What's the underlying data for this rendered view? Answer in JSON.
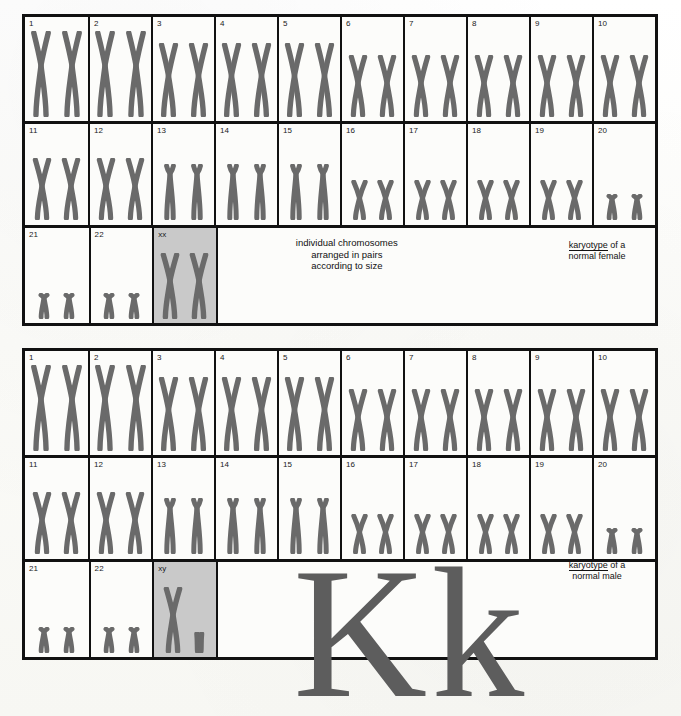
{
  "figure": {
    "annotation_note": "individual chromosomes\narranged in pairs\naccording to size",
    "annotation_line1": "individual chromosomes",
    "annotation_line2": "arranged in pairs",
    "annotation_line3": "according to size",
    "big_letters": "Kk",
    "colors": {
      "chromosome": "#6a6a6a",
      "border": "#111111",
      "shaded_cell": "#c9c9c9",
      "paper": "#fcfcfa",
      "big_letter": "#5d5d5d"
    }
  },
  "blocks": [
    {
      "id": "female",
      "caption_keyword": "karyotype",
      "caption_rest": " of a",
      "caption_line2": "normal female",
      "sex_pair_label": "xx",
      "rows": [
        {
          "name": "row-1",
          "cells": [
            {
              "label": "1",
              "pair": "large-sub"
            },
            {
              "label": "2",
              "pair": "large-sub"
            },
            {
              "label": "3",
              "pair": "large"
            },
            {
              "label": "4",
              "pair": "large"
            },
            {
              "label": "5",
              "pair": "large"
            },
            {
              "label": "6",
              "pair": "mid"
            },
            {
              "label": "7",
              "pair": "mid"
            },
            {
              "label": "8",
              "pair": "mid"
            },
            {
              "label": "9",
              "pair": "mid"
            },
            {
              "label": "10",
              "pair": "mid"
            }
          ]
        },
        {
          "name": "row-2",
          "cells": [
            {
              "label": "11",
              "pair": "mid"
            },
            {
              "label": "12",
              "pair": "mid"
            },
            {
              "label": "13",
              "pair": "acro"
            },
            {
              "label": "14",
              "pair": "acro"
            },
            {
              "label": "15",
              "pair": "acro"
            },
            {
              "label": "16",
              "pair": "small"
            },
            {
              "label": "17",
              "pair": "small"
            },
            {
              "label": "18",
              "pair": "small"
            },
            {
              "label": "19",
              "pair": "small"
            },
            {
              "label": "20",
              "pair": "tiny"
            }
          ]
        },
        {
          "name": "row-3",
          "cells": [
            {
              "label": "21",
              "pair": "tiny"
            },
            {
              "label": "22",
              "pair": "tiny"
            },
            {
              "label": "xx",
              "pair": "sex-xx",
              "shaded": true
            }
          ]
        }
      ]
    },
    {
      "id": "male",
      "caption_keyword": "karyotype",
      "caption_rest": " of a",
      "caption_line2": "normal male",
      "sex_pair_label": "xy",
      "rows": [
        {
          "name": "row-1",
          "cells": [
            {
              "label": "1",
              "pair": "large-sub"
            },
            {
              "label": "2",
              "pair": "large-sub"
            },
            {
              "label": "3",
              "pair": "large"
            },
            {
              "label": "4",
              "pair": "large"
            },
            {
              "label": "5",
              "pair": "large"
            },
            {
              "label": "6",
              "pair": "mid"
            },
            {
              "label": "7",
              "pair": "mid"
            },
            {
              "label": "8",
              "pair": "mid"
            },
            {
              "label": "9",
              "pair": "mid"
            },
            {
              "label": "10",
              "pair": "mid"
            }
          ]
        },
        {
          "name": "row-2",
          "cells": [
            {
              "label": "11",
              "pair": "mid"
            },
            {
              "label": "12",
              "pair": "mid"
            },
            {
              "label": "13",
              "pair": "acro"
            },
            {
              "label": "14",
              "pair": "acro"
            },
            {
              "label": "15",
              "pair": "acro"
            },
            {
              "label": "16",
              "pair": "small"
            },
            {
              "label": "17",
              "pair": "small"
            },
            {
              "label": "18",
              "pair": "small"
            },
            {
              "label": "19",
              "pair": "small"
            },
            {
              "label": "20",
              "pair": "tiny"
            }
          ]
        },
        {
          "name": "row-3",
          "cells": [
            {
              "label": "21",
              "pair": "tiny"
            },
            {
              "label": "22",
              "pair": "tiny"
            },
            {
              "label": "xy",
              "pair": "sex-xy",
              "shaded": true
            }
          ]
        }
      ]
    }
  ]
}
